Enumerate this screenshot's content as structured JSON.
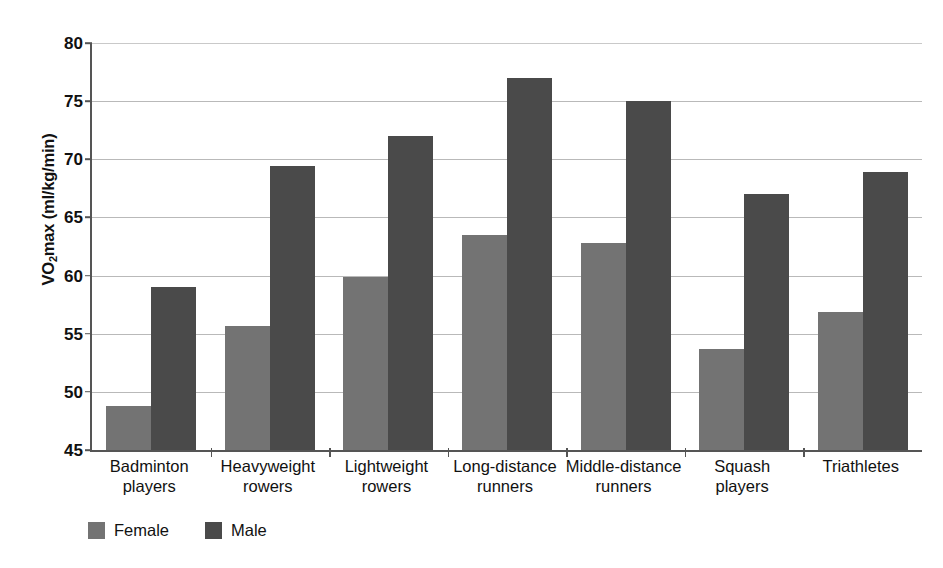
{
  "chart_data": {
    "type": "bar",
    "title": "",
    "subtitle": "",
    "xlabel": "",
    "ylabel": "VO2max (ml/kg/min)",
    "ylabel_parts": {
      "pre": "VO",
      "sub": "2",
      "post": "max (ml/kg/min)"
    },
    "ylim": [
      45,
      80
    ],
    "yticks": [
      45,
      50,
      55,
      60,
      65,
      70,
      75,
      80
    ],
    "ytick_labels": [
      "45",
      "50",
      "55",
      "60",
      "65",
      "70",
      "75",
      "80"
    ],
    "grid": true,
    "legend_position": "bottom-left",
    "categories": [
      "Badminton players",
      "Heavyweight rowers",
      "Lightweight rowers",
      "Long-distance runners",
      "Middle-distance runners",
      "Squash players",
      "Triathletes"
    ],
    "category_lines": [
      [
        "Badminton",
        "players"
      ],
      [
        "Heavyweight",
        "rowers"
      ],
      [
        "Lightweight",
        "rowers"
      ],
      [
        "Long-distance",
        "runners"
      ],
      [
        "Middle-distance",
        "runners"
      ],
      [
        "Squash",
        "players"
      ],
      [
        "Triathletes"
      ]
    ],
    "series": [
      {
        "name": "Female",
        "color": "#737373",
        "values": [
          48.8,
          55.7,
          59.9,
          63.5,
          62.8,
          53.7,
          56.9
        ]
      },
      {
        "name": "Male",
        "color": "#4a4a4a",
        "values": [
          59.0,
          69.4,
          72.0,
          77.0,
          75.0,
          67.0,
          68.9
        ]
      }
    ]
  },
  "legend": {
    "items": [
      {
        "label": "Female",
        "color": "#737373"
      },
      {
        "label": "Male",
        "color": "#4a4a4a"
      }
    ]
  }
}
